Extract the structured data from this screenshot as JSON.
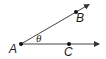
{
  "diagram": {
    "type": "angle",
    "vertex": {
      "label": "A",
      "x": 21,
      "y": 44
    },
    "rays": [
      {
        "name": "AB",
        "point": {
          "label": "B",
          "x": 76,
          "y": 12
        },
        "end": {
          "x": 90,
          "y": 4
        }
      },
      {
        "name": "AC",
        "point": {
          "label": "C",
          "x": 69,
          "y": 44
        },
        "end": {
          "x": 100,
          "y": 44
        }
      }
    ],
    "angle_label": "θ",
    "colors": {
      "stroke": "#333333",
      "text": "#1a1a1a"
    }
  }
}
